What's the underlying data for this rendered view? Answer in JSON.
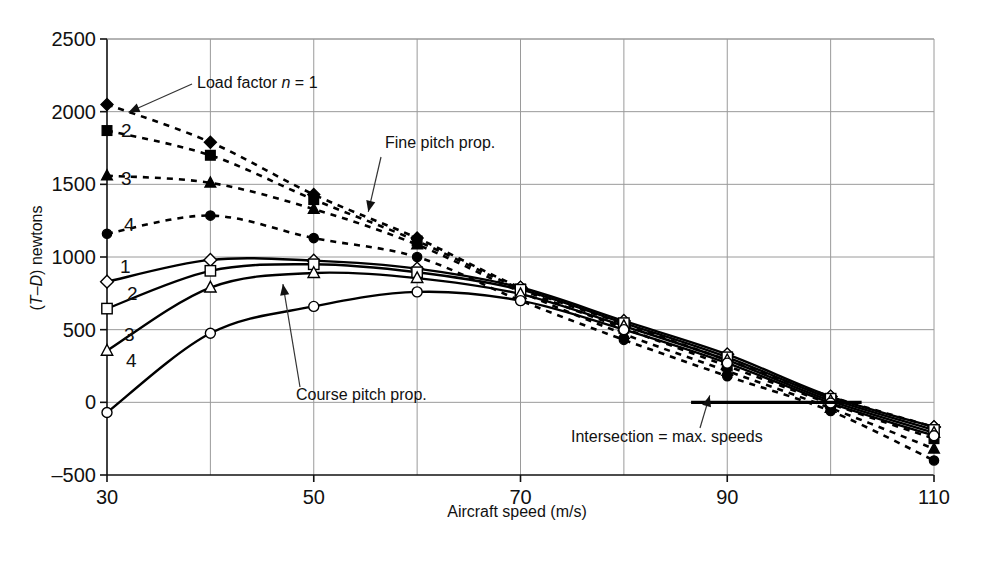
{
  "chart_data": {
    "type": "line",
    "title": "",
    "xlabel": "Aircraft speed (m/s)",
    "ylabel": "(T–D) newtons",
    "ylabel_parts": {
      "open": "(",
      "t": "T",
      "dash": "–",
      "d": "D",
      "close": ") newtons"
    },
    "xlim": [
      30,
      110
    ],
    "ylim": [
      -500,
      2500
    ],
    "xticks": [
      30,
      50,
      70,
      90,
      110
    ],
    "xticklabels": [
      "30",
      "50",
      "70",
      "90",
      "110"
    ],
    "yticks": [
      -500,
      0,
      500,
      1000,
      1500,
      2000,
      2500
    ],
    "yticklabels": [
      "–500",
      "0",
      "500",
      "1000",
      "1500",
      "2000",
      "2500"
    ],
    "grid": "horizontal-and-minor-vertical",
    "legend": "inline-labels",
    "x": [
      30,
      40,
      50,
      60,
      70,
      80,
      90,
      100,
      110
    ],
    "series": [
      {
        "name": "Fine pitch prop., n = 1",
        "label": "1",
        "style": "dashed",
        "marker": "diamond-filled",
        "group": "fine-pitch",
        "load_factor": 1,
        "values": [
          2050,
          1790,
          1430,
          1130,
          790,
          540,
          290,
          40,
          -170
        ]
      },
      {
        "name": "Fine pitch prop., n = 2",
        "label": "2",
        "style": "dashed",
        "marker": "square-filled",
        "group": "fine-pitch",
        "load_factor": 2,
        "values": [
          1870,
          1700,
          1395,
          1110,
          780,
          510,
          250,
          -10,
          -250
        ]
      },
      {
        "name": "Fine pitch prop., n = 3",
        "label": "3",
        "style": "dashed",
        "marker": "triangle-filled",
        "group": "fine-pitch",
        "load_factor": 3,
        "values": [
          1560,
          1510,
          1330,
          1085,
          760,
          470,
          215,
          -40,
          -320
        ]
      },
      {
        "name": "Fine pitch prop., n = 4",
        "label": "4",
        "style": "dashed",
        "marker": "circle-filled",
        "group": "fine-pitch",
        "load_factor": 4,
        "values": [
          1160,
          1285,
          1130,
          1000,
          700,
          430,
          180,
          -60,
          -400
        ]
      },
      {
        "name": "Course pitch prop., n = 1",
        "label": "1",
        "style": "solid",
        "marker": "diamond-open",
        "group": "course-pitch",
        "load_factor": 1,
        "values": [
          830,
          980,
          975,
          920,
          790,
          560,
          330,
          40,
          -170
        ]
      },
      {
        "name": "Course pitch prop., n = 2",
        "label": "2",
        "style": "solid",
        "marker": "square-open",
        "group": "course-pitch",
        "load_factor": 2,
        "values": [
          645,
          905,
          950,
          895,
          775,
          545,
          310,
          25,
          -190
        ]
      },
      {
        "name": "Course pitch prop., n = 3",
        "label": "3",
        "style": "solid",
        "marker": "triangle-open",
        "group": "course-pitch",
        "load_factor": 3,
        "values": [
          355,
          790,
          890,
          855,
          745,
          525,
          290,
          10,
          -210
        ]
      },
      {
        "name": "Course pitch prop., n = 4",
        "label": "4",
        "style": "solid",
        "marker": "circle-open",
        "group": "course-pitch",
        "load_factor": 4,
        "values": [
          -70,
          475,
          660,
          760,
          700,
          500,
          270,
          -5,
          -230
        ]
      }
    ],
    "annotations": [
      {
        "id": "load-factor",
        "text_plain": "Load factor n = 1",
        "prefix": "Load factor ",
        "symbol": "n",
        "suffix": " = 1",
        "points_to": [
          31.5,
          2010
        ]
      },
      {
        "id": "fine-pitch",
        "text_plain": "Fine pitch prop.",
        "points_to": [
          54.5,
          1290
        ]
      },
      {
        "id": "course-pitch",
        "text_plain": "Course pitch prop.",
        "points_to": [
          47.5,
          745
        ]
      },
      {
        "id": "intersection",
        "text_plain": "Intersection = max. speeds",
        "prefix": "Intersection ",
        "symbol": "=",
        "suffix": " max. speeds",
        "points_to": [
          88.5,
          20
        ]
      }
    ],
    "series_inline_labels": [
      {
        "text": "2",
        "group": "fine-pitch"
      },
      {
        "text": "3",
        "group": "fine-pitch"
      },
      {
        "text": "4",
        "group": "fine-pitch"
      },
      {
        "text": "1",
        "group": "course-pitch"
      },
      {
        "text": "2",
        "group": "course-pitch"
      },
      {
        "text": "3",
        "group": "course-pitch"
      },
      {
        "text": "4",
        "group": "course-pitch"
      }
    ],
    "marker_line_segment": {
      "description": "thick horizontal rule at y = 0 marking intersection band",
      "y": 0,
      "x_start": 86.5,
      "x_end": 103
    }
  },
  "colors": {
    "line": "#000000",
    "grid": "#9a9a9a",
    "axis": "#111111",
    "background": "#ffffff"
  }
}
